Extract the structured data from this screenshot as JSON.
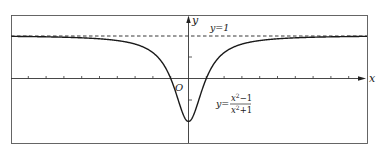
{
  "chart_data": {
    "type": "line",
    "title": "",
    "xlabel": "x",
    "ylabel": "y",
    "origin_label": "O",
    "function_label": "y = (x^2 - 1)/(x^2 + 1)",
    "function_label_parts": {
      "lhs": "y=",
      "numerator": "x²−1",
      "denominator": "x²+1"
    },
    "asymptote": {
      "y": 1,
      "label": "y=1",
      "style": "dashed"
    },
    "xlim": [
      -10,
      10
    ],
    "ylim": [
      -1.5,
      1.5
    ],
    "x_ticks_step": 1,
    "y_ticks": [
      -1,
      -0.5,
      0.5,
      1
    ],
    "grid": false,
    "legend": null,
    "key_points": [
      {
        "x": -1,
        "y": 0
      },
      {
        "x": 0,
        "y": -1
      },
      {
        "x": 1,
        "y": 0
      }
    ],
    "series": [
      {
        "name": "y=(x^2-1)/(x^2+1)",
        "x": [
          -10,
          -8,
          -6,
          -5,
          -4,
          -3,
          -2,
          -1.5,
          -1,
          -0.5,
          0,
          0.5,
          1,
          1.5,
          2,
          3,
          4,
          5,
          6,
          8,
          10
        ],
        "y": [
          0.98,
          0.969,
          0.946,
          0.923,
          0.882,
          0.8,
          0.6,
          0.385,
          0,
          -0.6,
          -1,
          -0.6,
          0,
          0.385,
          0.6,
          0.8,
          0.882,
          0.923,
          0.946,
          0.969,
          0.98
        ]
      }
    ]
  },
  "labels": {
    "x_axis": "x",
    "y_axis": "y",
    "origin": "O",
    "asymptote": "y=1",
    "eq_lhs": "y=",
    "eq_num_base": "x",
    "eq_num_rest": "−1",
    "eq_den_base": "x",
    "eq_den_rest": "+1",
    "eq_exp": "2"
  },
  "colors": {
    "curve": "#1a1a1a",
    "axes": "#333333",
    "frame": "#555555",
    "background": "#ffffff"
  }
}
